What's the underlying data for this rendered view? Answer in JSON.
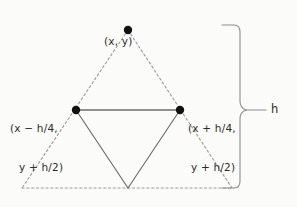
{
  "figure": {
    "background_color": "#fbfbfa",
    "outer_triangle_color": "#9a9a9a",
    "inner_triangle_color": "#6e6e6e",
    "vertex_dot_color": "#111111",
    "brace_color": "#8d8d8d",
    "text_color": "#2b2b2b"
  },
  "labels": {
    "apex": "(x, y)",
    "left_line1": "(x − h/4,",
    "left_line2": "y + h/2)",
    "right_line1": "(x + h/4,",
    "right_line2": "y + h/2)",
    "height": "h"
  },
  "geometry": {
    "outer_triangle": {
      "apex": [
        128,
        30
      ],
      "bottom_left": [
        22,
        188
      ],
      "bottom_right": [
        232,
        188
      ],
      "style": "dashed"
    },
    "inner_triangle": {
      "left": [
        76,
        110
      ],
      "right": [
        180,
        110
      ],
      "bottom": [
        128,
        188
      ],
      "style": "solid"
    },
    "vertex_dots": [
      [
        128,
        30
      ],
      [
        76,
        110
      ],
      [
        180,
        110
      ]
    ],
    "dot_radius": 4.2,
    "brace": {
      "top_y": 25,
      "bottom_y": 188,
      "x": 240,
      "mid_y": 110,
      "tick_end_x": 266
    }
  }
}
